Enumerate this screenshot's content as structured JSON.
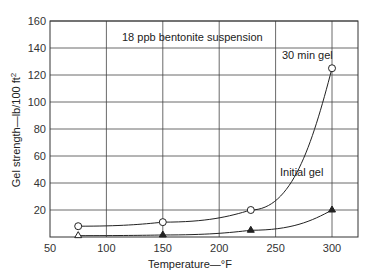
{
  "chart_data": {
    "type": "line",
    "title": "18 ppb bentonite suspension",
    "xlabel": "Temperature—°F",
    "ylabel": "Gel strength—lb/100 ft²",
    "xlim": [
      50,
      325
    ],
    "ylim": [
      0,
      160
    ],
    "xticks": [
      50,
      100,
      150,
      200,
      250,
      300
    ],
    "yticks": [
      20,
      40,
      60,
      80,
      100,
      120,
      140,
      160
    ],
    "grid": true,
    "legend_position": "inline annotations",
    "series": [
      {
        "name": "30 min gel",
        "marker": "open-circle",
        "x": [
          75,
          150,
          228,
          300
        ],
        "values": [
          8,
          11,
          20,
          125
        ]
      },
      {
        "name": "Initial gel",
        "marker": "filled-triangle",
        "x": [
          75,
          150,
          228,
          300
        ],
        "values": [
          1,
          1.5,
          5,
          20
        ]
      }
    ]
  },
  "labels": {
    "title": "18 ppb bentonite suspension",
    "xlabel": "Temperature—°F",
    "ylabel_main": "Gel strength—lb/100 ft",
    "ylabel_sup": "2",
    "series_30min": "30 min gel",
    "series_initial": "Initial gel",
    "xticks": [
      "50",
      "100",
      "150",
      "200",
      "250",
      "300"
    ],
    "yticks": [
      "20",
      "40",
      "60",
      "80",
      "100",
      "120",
      "140",
      "160"
    ]
  }
}
